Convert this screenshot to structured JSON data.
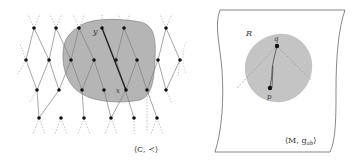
{
  "figure": {
    "left_panel": {
      "name": "causal-set",
      "label": "⟨C, ≺⟩",
      "region_fill": "#b3b3b3",
      "node_color": "#111111",
      "edge_color": "#888888",
      "highlight_edge_color": "#222222",
      "labels": {
        "y": "y",
        "x": "x"
      }
    },
    "right_panel": {
      "name": "spacetime-manifold",
      "region_label": "R",
      "manifold_label": "⟨M, g",
      "manifold_sub": "ab",
      "manifold_close": "⟩",
      "disk_fill": "#c4c4c4",
      "points": {
        "q": "q",
        "p": "p"
      }
    }
  }
}
